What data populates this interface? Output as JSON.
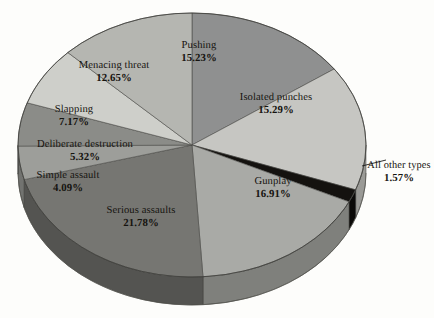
{
  "chart_data": {
    "type": "pie",
    "title": "",
    "subtitle": "",
    "xlabel": "",
    "ylabel": "",
    "legend_position": "none",
    "grid": false,
    "style": "3d-exploded-none-grayscale",
    "background_color": "#fdfdfb",
    "center": {
      "x": 192,
      "y": 145
    },
    "radii": {
      "rx": 174,
      "ry": 132
    },
    "depth_px": 28,
    "start_angle_deg": 0,
    "direction": "clockwise",
    "categories": [
      "Pushing",
      "Isolated punches",
      "All other types",
      "Gunplay",
      "Serious assaults",
      "Simple assault",
      "Deliberate destruction",
      "Slapping",
      "Menacing threat"
    ],
    "values": [
      15.23,
      15.29,
      1.57,
      16.91,
      21.78,
      4.09,
      5.32,
      7.17,
      12.65
    ],
    "value_labels": [
      "15.23%",
      "15.29%",
      "1.57%",
      "16.91%",
      "21.78%",
      "4.09%",
      "5.32%",
      "7.17%",
      "12.65%"
    ],
    "slice_colors": [
      "#8f9090",
      "#c6c6c2",
      "#14120f",
      "#a9aaa6",
      "#767672",
      "#9d9e9a",
      "#8b8c88",
      "#cecfca",
      "#b5b6b1"
    ],
    "side_colors": [
      "#6a6b68",
      "#9a9a96",
      "#0b0a08",
      "#7f807c",
      "#545451",
      "#727370",
      "#646562",
      "#a2a39e",
      "#878884"
    ],
    "slices": [
      {
        "label": "Pushing",
        "value": 15.23,
        "value_label": "15.23%",
        "fill": "#8f9090",
        "side": "#6a6b68"
      },
      {
        "label": "Isolated punches",
        "value": 15.29,
        "value_label": "15.29%",
        "fill": "#c6c6c2",
        "side": "#9a9a96"
      },
      {
        "label": "All other types",
        "value": 1.57,
        "value_label": "1.57%",
        "fill": "#14120f",
        "side": "#0b0a08"
      },
      {
        "label": "Gunplay",
        "value": 16.91,
        "value_label": "16.91%",
        "fill": "#a9aaa6",
        "side": "#7f807c"
      },
      {
        "label": "Serious assaults",
        "value": 21.78,
        "value_label": "21.78%",
        "fill": "#767672",
        "side": "#545451"
      },
      {
        "label": "Simple assault",
        "value": 4.09,
        "value_label": "4.09%",
        "fill": "#9d9e9a",
        "side": "#727370"
      },
      {
        "label": "Deliberate destruction",
        "value": 5.32,
        "value_label": "5.32%",
        "fill": "#8b8c88",
        "side": "#646562"
      },
      {
        "label": "Slapping",
        "value": 7.17,
        "value_label": "7.17%",
        "fill": "#cecfca",
        "side": "#a2a39e"
      },
      {
        "label": "Menacing threat",
        "value": 12.65,
        "value_label": "12.65%",
        "fill": "#b5b6b1",
        "side": "#878884"
      }
    ],
    "total_percent": 100.01,
    "annotations": [
      {
        "name": "all-other-types-leader",
        "text": "All other types 1.57%",
        "type": "leader-line",
        "from": {
          "x": 362,
          "y": 166
        },
        "to": {
          "x": 386,
          "y": 160
        }
      }
    ]
  },
  "labels": {
    "pushing": {
      "name": "Pushing",
      "percent": "15.23%"
    },
    "isolated": {
      "name": "Isolated punches",
      "percent": "15.29%"
    },
    "allother": {
      "name": "All other types",
      "percent": "1.57%"
    },
    "gunplay": {
      "name": "Gunplay",
      "percent": "16.91%"
    },
    "serious": {
      "name": "Serious assaults",
      "percent": "21.78%"
    },
    "simple": {
      "name": "Simple assault",
      "percent": "4.09%"
    },
    "deliberate": {
      "name": "Deliberate destruction",
      "percent": "5.32%"
    },
    "slapping": {
      "name": "Slapping",
      "percent": "7.17%"
    },
    "menacing": {
      "name": "Menacing threat",
      "percent": "12.65%"
    }
  }
}
